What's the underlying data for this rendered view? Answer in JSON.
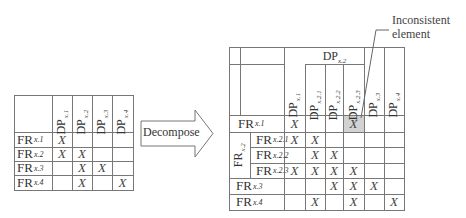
{
  "left_matrix": {
    "columns": [
      "x.1",
      "x.2",
      "x.3",
      "x.4"
    ],
    "column_prefix": "DP",
    "rows": [
      {
        "label": "x.1",
        "cells": [
          "X",
          "",
          "",
          ""
        ]
      },
      {
        "label": "x.2",
        "cells": [
          "X",
          "X",
          "",
          ""
        ]
      },
      {
        "label": "x.3",
        "cells": [
          "",
          "X",
          "X",
          ""
        ]
      },
      {
        "label": "x.4",
        "cells": [
          "",
          "X",
          "",
          "X"
        ]
      }
    ],
    "row_prefix": "FR"
  },
  "arrow": {
    "label": "Decompose"
  },
  "right_matrix": {
    "group_header": {
      "prefix": "DP",
      "sub": "x.2"
    },
    "columns": [
      "x.1",
      "x.2.1",
      "x.2.2",
      "x.2.3",
      "x.3",
      "x.4"
    ],
    "row_group": {
      "prefix": "FR",
      "sub": "x.2"
    },
    "rows": [
      {
        "label": "x.1",
        "cells": [
          "X",
          "",
          "",
          "X",
          "",
          ""
        ]
      },
      {
        "label": "x.2.1",
        "cells": [
          "X",
          "X",
          "",
          "",
          "",
          ""
        ]
      },
      {
        "label": "x.2.2",
        "cells": [
          "",
          "X",
          "X",
          "",
          "",
          ""
        ]
      },
      {
        "label": "x.2.3",
        "cells": [
          "X",
          "X",
          "X",
          "X",
          "",
          ""
        ]
      },
      {
        "label": "x.3",
        "cells": [
          "",
          "",
          "X",
          "X",
          "X",
          ""
        ]
      },
      {
        "label": "x.4",
        "cells": [
          "",
          "X",
          "",
          "X",
          "",
          "X"
        ]
      }
    ],
    "highlighted_cell": {
      "row": 0,
      "col": 3,
      "color": "#d2d2d2"
    }
  },
  "annotation": {
    "line1": "Inconsistent",
    "line2": "element"
  }
}
